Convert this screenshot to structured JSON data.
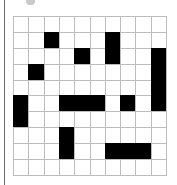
{
  "puzzle": {
    "rows": 10,
    "cols": 10,
    "filled_color": "#000000",
    "empty_color": "#ffffff",
    "grid_line_color": "#bdbdbd",
    "cells": [
      [
        0,
        0,
        0,
        0,
        0,
        0,
        0,
        0,
        0,
        0
      ],
      [
        0,
        0,
        1,
        0,
        0,
        0,
        1,
        0,
        0,
        0
      ],
      [
        0,
        0,
        0,
        0,
        1,
        0,
        1,
        0,
        0,
        1
      ],
      [
        0,
        1,
        0,
        0,
        0,
        0,
        0,
        0,
        0,
        1
      ],
      [
        0,
        0,
        0,
        0,
        0,
        0,
        0,
        0,
        0,
        1
      ],
      [
        1,
        0,
        0,
        1,
        1,
        1,
        0,
        1,
        0,
        1
      ],
      [
        1,
        0,
        0,
        0,
        0,
        0,
        0,
        0,
        0,
        0
      ],
      [
        0,
        0,
        0,
        1,
        0,
        0,
        0,
        0,
        0,
        0
      ],
      [
        0,
        0,
        0,
        1,
        0,
        0,
        1,
        1,
        1,
        0
      ],
      [
        0,
        0,
        0,
        0,
        0,
        0,
        0,
        0,
        0,
        0
      ]
    ]
  }
}
